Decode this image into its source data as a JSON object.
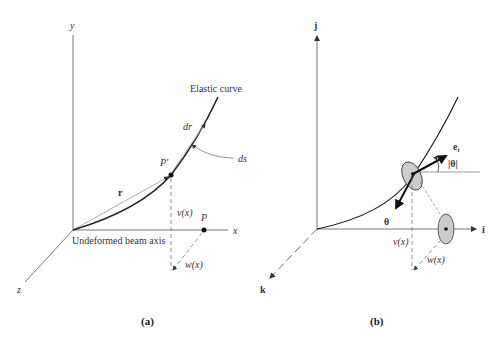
{
  "panel_a": {
    "caption": "(a)",
    "axis_y": "y",
    "axis_x": "x",
    "axis_z": "z",
    "curve_label": "Elastic curve",
    "dr_label": "dr",
    "ds_label": "ds",
    "p_prime_label": "P'",
    "r_label": "r",
    "v_label": "v(x)",
    "p_label": "P",
    "w_label": "w(x)",
    "beam_axis_label": "Undeformed beam axis"
  },
  "panel_b": {
    "caption": "(b)",
    "axis_j": "j",
    "axis_i": "i",
    "axis_k": "k",
    "et_label": "e",
    "et_sub": "t",
    "theta_mag_label": "|θ|",
    "theta_label": "θ",
    "v_label": "v(x)",
    "w_label": "w(x)"
  },
  "colors": {
    "line": "#555555",
    "curve": "#222222",
    "ellipse_fill": "#cccccc"
  }
}
